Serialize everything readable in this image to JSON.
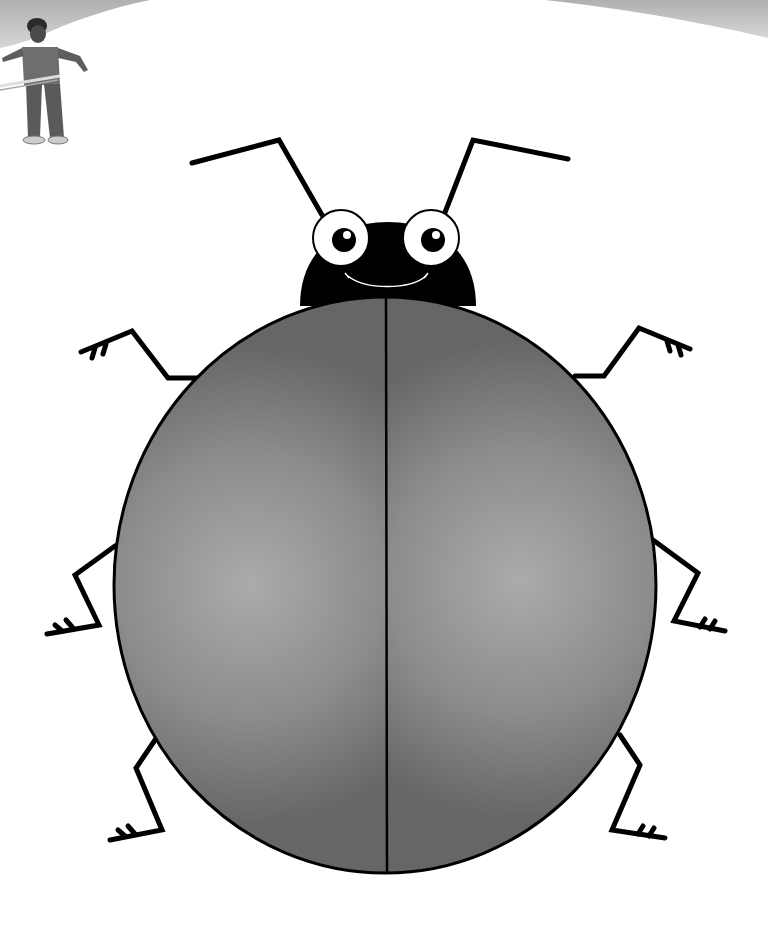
{
  "scene": {
    "title": "Ladybug coloring page",
    "background_color": "#ffffff",
    "top_banner_color": "#b8b8b8"
  },
  "character": {
    "name": "boy-with-hula-hoop",
    "shirt_color": "#6e6e6e",
    "pants_color": "#5a5a5a",
    "skin_color": "#4a4a4a",
    "hoop_color": "#d8d8d8"
  },
  "bug": {
    "shell_dark_color": "#6a6a6a",
    "shell_light_color": "#aaaaaa",
    "outline_color": "#000000",
    "head_color": "#000000",
    "eye_white_color": "#ffffff",
    "pupil_color": "#000000",
    "leg_count": 6,
    "antenna_count": 2
  }
}
